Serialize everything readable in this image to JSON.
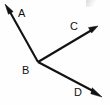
{
  "figure": {
    "type": "geometry-diagram",
    "width": 110,
    "height": 105,
    "background_color": "#fefefe",
    "stroke_color": "#121212",
    "label_color": "#111111",
    "vertex": {
      "name": "B",
      "label": "B",
      "x": 38,
      "y": 62
    },
    "rays": [
      {
        "name": "ray-BA",
        "label": "A",
        "from": {
          "x": 38,
          "y": 62
        },
        "to": {
          "x": 6,
          "y": 6
        },
        "arrowhead": "at-tip",
        "direction": "up-left"
      },
      {
        "name": "ray-BC",
        "label": "C",
        "from": {
          "x": 38,
          "y": 62
        },
        "to": {
          "x": 97,
          "y": 27
        },
        "arrowhead": "at-tip",
        "direction": "up-right"
      },
      {
        "name": "ray-BD",
        "label": "D",
        "from": {
          "x": 38,
          "y": 62
        },
        "to": {
          "x": 101,
          "y": 96
        },
        "arrowhead": "at-tip",
        "direction": "down-right"
      }
    ],
    "labels": {
      "A": "A",
      "B": "B",
      "C": "C",
      "D": "D"
    }
  }
}
